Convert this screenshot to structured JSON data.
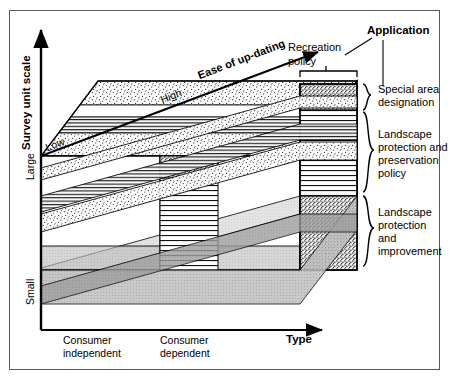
{
  "figure": {
    "type": "3d-block-diagram",
    "title_none": "",
    "axes": {
      "y_axis": {
        "label": "Survey unit scale",
        "bold": true,
        "ticks": [
          "Large",
          "Small"
        ],
        "tick_top": "Large",
        "tick_bottom": "Small",
        "arrow": "up"
      },
      "x_axis": {
        "label": "Type",
        "bold": true,
        "ticks": [
          "Consumer independent",
          "Consumer dependent"
        ],
        "tick_1_line1": "Consumer",
        "tick_1_line2": "independent",
        "tick_2_line1": "Consumer",
        "tick_2_line2": "dependent",
        "arrow": "right"
      },
      "z_axis": {
        "label": "Ease of up-dating",
        "bold": true,
        "ticks": [
          "Low",
          "High"
        ],
        "tick_near": "Low",
        "tick_far": "High",
        "arrow": "up-right"
      }
    },
    "callouts": {
      "application_header": "Application",
      "recreation_policy_line1": "Recreation",
      "recreation_policy_line2": "policy",
      "brace_items": [
        {
          "id": "special-area",
          "line1": "Special area",
          "line2": "designation",
          "line3": "",
          "line4": ""
        },
        {
          "id": "landscape-preservation",
          "line1": "Landscape",
          "line2": "protection and",
          "line3": "preservation",
          "line4": "policy"
        },
        {
          "id": "landscape-improvement",
          "line1": "Landscape",
          "line2": "protection",
          "line3": "and",
          "line4": "improvement"
        }
      ]
    },
    "colors": {
      "line": "#000000",
      "frame": "#5a5a5a",
      "background": "#ffffff",
      "fill_light": "#f2f2f2",
      "fill_mid": "#d9d9d9",
      "fill_dark": "#a8a8a8"
    },
    "fill_patterns": [
      "stipple-dots",
      "horizontal-lines",
      "dense-stipple",
      "plain-white",
      "light-grey",
      "mid-grey"
    ]
  }
}
